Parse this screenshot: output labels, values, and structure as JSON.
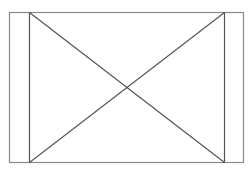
{
  "canvas": {
    "width": 252,
    "height": 172,
    "background": "#ffffff"
  },
  "figure": {
    "kind": "placeholder-x-box",
    "stroke_outer": "#8a8a8a",
    "stroke_inner": "#555555",
    "outer_rect": {
      "x1": 9,
      "y1": 12,
      "x2": 243,
      "y2": 162
    },
    "inner_verticals": [
      29,
      224
    ],
    "diagonals": [
      {
        "x1": 29,
        "y1": 12,
        "x2": 224,
        "y2": 162
      },
      {
        "x1": 224,
        "y1": 12,
        "x2": 29,
        "y2": 162
      }
    ]
  }
}
